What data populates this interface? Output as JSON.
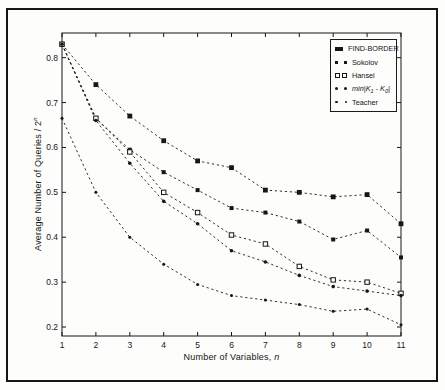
{
  "figure": {
    "background": "#fdfdfc",
    "ink_color": "#161616",
    "border": "outer-box"
  },
  "chart_data": {
    "type": "line",
    "title": "",
    "xlabel_main": "Number of Variables, ",
    "xlabel_var": "n",
    "ylabel_main": "Average Number of Queries / 2",
    "ylabel_sup": "n",
    "line_style": "dashed",
    "grid": false,
    "legend_position": "upper-right",
    "xlim": [
      1,
      11
    ],
    "ylim": [
      0.18,
      0.855
    ],
    "x": [
      1,
      2,
      3,
      4,
      5,
      6,
      7,
      8,
      9,
      10,
      11
    ],
    "xticks": [
      "1",
      "2",
      "3",
      "4",
      "5",
      "6",
      "7",
      "8",
      "9",
      "10",
      "11"
    ],
    "ytick_values": [
      0.2,
      0.3,
      0.4,
      0.5,
      0.6,
      0.7,
      0.8
    ],
    "yticks": [
      "0.2",
      "0.3",
      "0.4",
      "0.5",
      "0.6",
      "0.7",
      "0.8"
    ],
    "series": [
      {
        "name": "FIND-BORDER",
        "marker": "square-filled",
        "values": [
          0.83,
          0.74,
          0.67,
          0.615,
          0.57,
          0.555,
          0.505,
          0.5,
          0.49,
          0.495,
          0.43
        ]
      },
      {
        "name": "Sokolov",
        "marker": "square-filled-small",
        "values": [
          0.83,
          0.665,
          0.595,
          0.545,
          0.505,
          0.465,
          0.455,
          0.435,
          0.395,
          0.415,
          0.355
        ]
      },
      {
        "name": "Hansel",
        "marker": "square-open",
        "values": [
          0.83,
          0.665,
          0.59,
          0.5,
          0.455,
          0.405,
          0.385,
          0.335,
          0.305,
          0.3,
          0.275
        ]
      },
      {
        "name": "min|K1 - K0|",
        "italic": true,
        "marker": "dot",
        "name_parts": {
          "pre": "min|K",
          "sub1": "1",
          "mid": " - K",
          "sub2": "0",
          "post": "|"
        },
        "values": [
          0.83,
          0.66,
          0.565,
          0.48,
          0.43,
          0.37,
          0.345,
          0.315,
          0.29,
          0.28,
          0.27
        ]
      },
      {
        "name": "Teacher",
        "marker": "dot-small",
        "values": [
          0.665,
          0.5,
          0.4,
          0.34,
          0.295,
          0.27,
          0.26,
          0.25,
          0.235,
          0.24,
          0.205
        ]
      }
    ]
  }
}
